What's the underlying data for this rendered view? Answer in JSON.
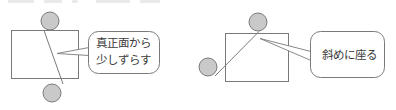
{
  "figure": {
    "background_color": "#ffffff",
    "stroke_color": "#7a7a7a",
    "text_color": "#3b3b3b",
    "circle_fill": "#c9c9c9",
    "rect_fill": "#ffffff",
    "bubble_fill": "#ffffff"
  },
  "panels": [
    {
      "id": "left",
      "name": "slightly-offset-from-front",
      "desk": {
        "x": 11,
        "y": 30,
        "width": 67,
        "height": 48
      },
      "people": [
        {
          "name": "person-top",
          "cx": 50,
          "cy": 21,
          "r": 9
        },
        {
          "name": "person-bottom",
          "cx": 52,
          "cy": 93,
          "r": 9
        }
      ],
      "gaze_line": {
        "x1": 44,
        "y1": 30,
        "x2": 63,
        "y2": 84
      },
      "pointer": {
        "tip_x": 57,
        "tip_y": 54,
        "end_x": 88,
        "end_y": 51
      },
      "callout": {
        "x": 88,
        "y": 31,
        "width": 72,
        "height": 43,
        "lines": [
          "真正面から",
          "少しずらす"
        ]
      }
    },
    {
      "id": "right",
      "name": "sit-at-an-angle",
      "desk": {
        "x": 225,
        "y": 33,
        "width": 63,
        "height": 48
      },
      "people": [
        {
          "name": "person-top",
          "cx": 258,
          "cy": 22,
          "r": 9
        },
        {
          "name": "person-left",
          "cx": 208,
          "cy": 67,
          "r": 9
        }
      ],
      "gaze_line": {
        "x1": 215,
        "y1": 76,
        "x2": 259,
        "y2": 31
      },
      "pointer": {
        "tip_x": 261,
        "tip_y": 41,
        "end_x": 310,
        "end_y": 56
      },
      "callout": {
        "x": 310,
        "y": 31,
        "width": 75,
        "height": 47,
        "lines": [
          "斜めに座る"
        ]
      }
    }
  ],
  "artifacts": {
    "top_clipped_text_row": [
      {
        "x": 8,
        "width": 26
      },
      {
        "x": 44,
        "width": 18
      },
      {
        "x": 72,
        "width": 6
      },
      {
        "x": 96,
        "width": 34
      },
      {
        "x": 140,
        "width": 20
      }
    ]
  }
}
